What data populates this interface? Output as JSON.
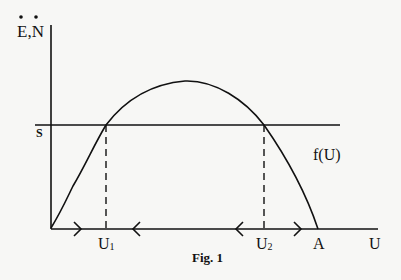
{
  "figure": {
    "caption": "Fig. 1",
    "y_axis_label": "E,N",
    "y_axis_label_dots": "double-dot accent over E and N",
    "x_axis_label": "U",
    "horizontal_line_label": "S",
    "curve_label": "f(U)",
    "points": {
      "u1": "U1",
      "u1_main": "U",
      "u1_sub": "1",
      "u2": "U2",
      "u2_main": "U",
      "u2_sub": "2",
      "a": "A"
    },
    "arrows": [
      {
        "position": "right of origin",
        "direction": "right"
      },
      {
        "position": "left of U2 side, between U1 and U2",
        "direction": "left"
      },
      {
        "position": "left of U2",
        "direction": "left"
      },
      {
        "position": "between U2 and A",
        "direction": "right"
      }
    ],
    "colors": {
      "ink": "#111111",
      "paper": "#f7f7f5"
    }
  }
}
